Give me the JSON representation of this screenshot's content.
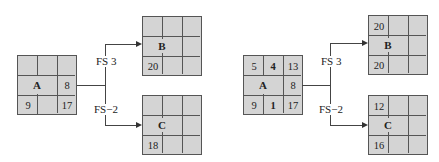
{
  "diagrams": [
    {
      "name": "before",
      "nodes": {
        "A": {
          "label": "A",
          "es": "",
          "dur": "",
          "ef": "",
          "slack": "8",
          "ls": "9",
          "tf": "",
          "lf": "17"
        },
        "B": {
          "label": "B",
          "es": "",
          "dur": "",
          "ef": "",
          "slack": "",
          "ls": "20",
          "tf": "",
          "lf": ""
        },
        "C": {
          "label": "C",
          "es": "",
          "dur": "",
          "ef": "",
          "slack": "",
          "ls": "18",
          "tf": "",
          "lf": ""
        }
      },
      "links": [
        {
          "from": "A",
          "to": "B",
          "label": "FS 3"
        },
        {
          "from": "A",
          "to": "C",
          "label": "FS−2"
        }
      ]
    },
    {
      "name": "after",
      "nodes": {
        "A": {
          "label": "A",
          "es": "5",
          "dur": "4",
          "ef": "13",
          "slack": "8",
          "ls": "9",
          "tf": "1",
          "lf": "17"
        },
        "B": {
          "label": "B",
          "es": "20",
          "dur": "",
          "ef": "",
          "slack": "",
          "ls": "20",
          "tf": "",
          "lf": ""
        },
        "C": {
          "label": "C",
          "es": "12",
          "dur": "",
          "ef": "",
          "slack": "",
          "ls": "16",
          "tf": "",
          "lf": ""
        }
      },
      "links": [
        {
          "from": "A",
          "to": "B",
          "label": "FS 3"
        },
        {
          "from": "A",
          "to": "C",
          "label": "FS−2"
        }
      ]
    }
  ]
}
